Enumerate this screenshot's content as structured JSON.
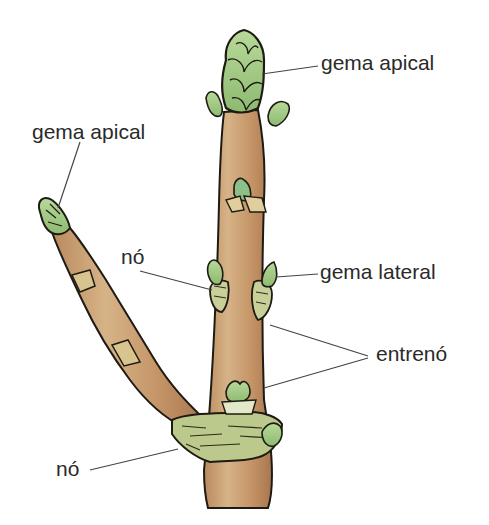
{
  "diagram": {
    "colors": {
      "stem": "#c4996a",
      "stem_shadow": "#a8764f",
      "stem_light": "#d9b98e",
      "bud_green": "#a9cf8a",
      "bud_dark": "#7fae64",
      "outline": "#1e1a14",
      "node_green": "#b9c98a",
      "leader_line": "#444444",
      "label_text": "#2a2a2a"
    },
    "labels": [
      {
        "id": "gema-apical-main",
        "text": "gema apical",
        "x": 321,
        "y": 52
      },
      {
        "id": "gema-apical-side",
        "text": "gema apical",
        "x": 32,
        "y": 121
      },
      {
        "id": "no-upper",
        "text": "nó",
        "x": 121,
        "y": 246
      },
      {
        "id": "gema-lateral",
        "text": "gema lateral",
        "x": 320,
        "y": 261
      },
      {
        "id": "entreno",
        "text": "entrenó",
        "x": 376,
        "y": 343
      },
      {
        "id": "no-lower",
        "text": "nó",
        "x": 56,
        "y": 458
      }
    ]
  }
}
